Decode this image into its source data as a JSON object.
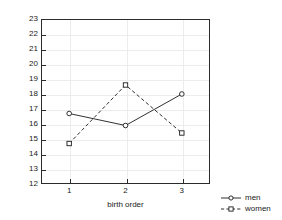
{
  "chart_data": {
    "type": "line",
    "title": "",
    "xlabel": "birth order",
    "ylabel": "",
    "x": [
      1,
      2,
      3
    ],
    "categories": [
      "1",
      "2",
      "3"
    ],
    "xtick_labels": [
      "1",
      "2",
      "3"
    ],
    "ytick_labels": [
      "23",
      "22",
      "21",
      "20",
      "19",
      "18",
      "17",
      "16",
      "15",
      "14",
      "13",
      "12"
    ],
    "xlim": [
      0.5,
      3.5
    ],
    "ylim": [
      12,
      23
    ],
    "grid": true,
    "legend_position": "outside bottom-right",
    "series": [
      {
        "name": "men",
        "values": [
          16.7,
          15.9,
          18.0
        ],
        "line_style": "solid",
        "marker": "circle",
        "color": "#1a1a1a"
      },
      {
        "name": "women",
        "values": [
          14.7,
          18.6,
          15.4
        ],
        "line_style": "dashed",
        "marker": "square",
        "color": "#1a1a1a"
      }
    ]
  },
  "legend": {
    "entries": [
      {
        "label": "men"
      },
      {
        "label": "women"
      }
    ]
  },
  "axes": {
    "x_axis_label": "birth order"
  }
}
